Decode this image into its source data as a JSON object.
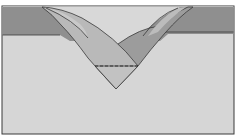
{
  "diagram": {
    "type": "folding-illustration",
    "colors": {
      "background": "#ffffff",
      "paper_light": "#d6d6d6",
      "band_dark": "#8f8f8f",
      "band_top_light": "#dcdcdc",
      "flap_left": "#b9b9b9",
      "flap_left_inner": "#c9c9c9",
      "flap_right": "#9c9c9c",
      "flap_right_inner": "#bcbcbc",
      "point": "#c2c2c2",
      "outline": "#3a3a3a"
    },
    "elements": {
      "border": "rectangular frame",
      "band": "dark horizontal band across top",
      "left_flap": "curved flap from top-left meeting at center point",
      "right_flap": "curved flap from top-right meeting at center point",
      "fold_line": "dashed horizontal fold line above bottom point"
    }
  }
}
